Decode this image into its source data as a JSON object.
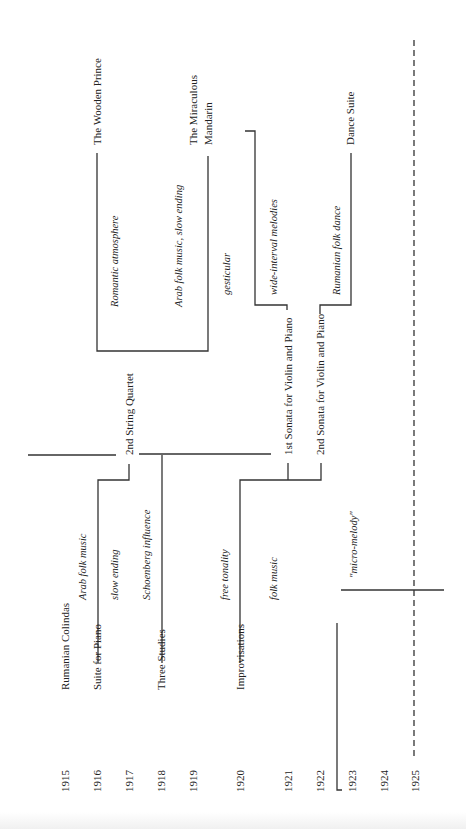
{
  "years": [
    {
      "label": "1915",
      "x": 65
    },
    {
      "label": "1916",
      "x": 97
    },
    {
      "label": "1917",
      "x": 129
    },
    {
      "label": "1918",
      "x": 161
    },
    {
      "label": "1919",
      "x": 193
    },
    {
      "label": "1920",
      "x": 240
    },
    {
      "label": "1921",
      "x": 288
    },
    {
      "label": "1922",
      "x": 320
    },
    {
      "label": "1923",
      "x": 352
    },
    {
      "label": "1924",
      "x": 384
    },
    {
      "label": "1925",
      "x": 415
    }
  ],
  "works": [
    {
      "label": "Rumanian Colindas",
      "x": 65,
      "y": 690
    },
    {
      "label": "Suite for Piano",
      "x": 97,
      "y": 690
    },
    {
      "label": "Three Studies",
      "x": 161,
      "y": 690
    },
    {
      "label": "Improvisations",
      "x": 240,
      "y": 690
    },
    {
      "label": "2nd String Quartet",
      "x": 129,
      "y": 455
    },
    {
      "label": "1st Sonata for Violin and Piano",
      "x": 288,
      "y": 455
    },
    {
      "label": "2nd Sonata for Violin and Piano",
      "x": 320,
      "y": 455
    },
    {
      "label": "The Wooden Prince",
      "x": 97,
      "y": 145
    },
    {
      "label": "The Miraculous",
      "x": 193,
      "y": 145
    },
    {
      "label": "Mandarin",
      "x": 208,
      "y": 145
    },
    {
      "label": "Dance Suite",
      "x": 350,
      "y": 145
    }
  ],
  "annotations": [
    {
      "label": "Arab folk music",
      "x": 82,
      "y": 600
    },
    {
      "label": "slow ending",
      "x": 114,
      "y": 600
    },
    {
      "label": "Schoenberg influence",
      "x": 146,
      "y": 600
    },
    {
      "label": "free tonality",
      "x": 224,
      "y": 600
    },
    {
      "label": "folk music",
      "x": 273,
      "y": 600
    },
    {
      "label": "\"micro-melody\"",
      "x": 353,
      "y": 578
    },
    {
      "label": "Romantic atmosphere",
      "x": 114,
      "y": 307
    },
    {
      "label": "Arab folk music, slow ending",
      "x": 178,
      "y": 307
    },
    {
      "label": "gesticular",
      "x": 226,
      "y": 295
    },
    {
      "label": "wide-interval melodies",
      "x": 273,
      "y": 295
    },
    {
      "label": "Rumanian folk dance",
      "x": 336,
      "y": 295
    }
  ]
}
